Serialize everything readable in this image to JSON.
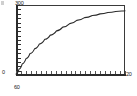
{
  "chart_data": {
    "type": "line",
    "title": "",
    "subtitle": "",
    "xlabel": "",
    "ylabel": "",
    "grid": false,
    "legend": null,
    "legend_position": "none",
    "xlim": [
      60,
      200
    ],
    "ylim": [
      0,
      300
    ],
    "x_tick_labels": [
      "60",
      "20"
    ],
    "y_tick_labels": [
      "300",
      "0"
    ],
    "axis_labels": {
      "y_max": "300",
      "y_min": "0",
      "x_min": "60",
      "x_max": "20"
    },
    "minor_ticks": {
      "x_count": 22,
      "y_count": 16
    },
    "series": [
      {
        "name": "curve",
        "color": "#2a2a2a",
        "x": [
          60,
          64,
          68,
          73,
          78,
          84,
          90,
          97,
          104,
          112,
          120,
          129,
          138,
          148,
          158,
          168,
          178,
          188,
          196,
          200
        ],
        "y": [
          4,
          26,
          48,
          71,
          92,
          113,
          133,
          153,
          171,
          189,
          205,
          220,
          234,
          246,
          255,
          262,
          268,
          272,
          274,
          275
        ]
      }
    ],
    "axis_color": "#2b2b2b",
    "frame_color": "#3a3a3a",
    "background": "#ffffff"
  },
  "figure": {
    "corner_mark": "scan-artifact"
  }
}
